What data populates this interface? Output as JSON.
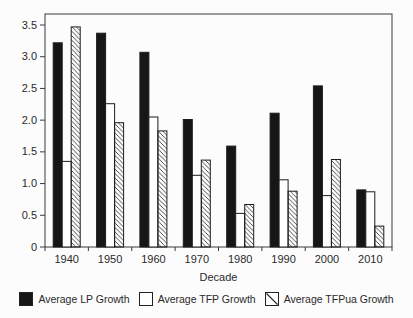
{
  "chart_data": {
    "type": "bar",
    "title": "",
    "xlabel": "Decade",
    "ylabel": "",
    "ylim": [
      0,
      3.5
    ],
    "yticks": [
      0,
      0.5,
      1.0,
      1.5,
      2.0,
      2.5,
      3.0,
      3.5
    ],
    "ytick_labels": [
      "0",
      "0.5",
      "1.0",
      "1.5",
      "2.0",
      "2.5",
      "3.0",
      "3.5"
    ],
    "grid": false,
    "legend_position": "bottom",
    "categories": [
      "1940",
      "1950",
      "1960",
      "1970",
      "1980",
      "1990",
      "2000",
      "2010"
    ],
    "series": [
      {
        "name": "Average LP Growth",
        "style": "solid-black",
        "values": [
          3.22,
          3.37,
          3.07,
          2.01,
          1.59,
          2.11,
          2.54,
          0.9
        ]
      },
      {
        "name": "Average TFP Growth",
        "style": "white",
        "values": [
          1.35,
          2.26,
          2.05,
          1.13,
          0.53,
          1.06,
          0.81,
          0.87
        ]
      },
      {
        "name": "Average TFPua Growth",
        "style": "diagonal-hatch",
        "values": [
          3.47,
          1.96,
          1.83,
          1.37,
          0.67,
          0.88,
          1.38,
          0.33
        ]
      }
    ],
    "colors": {
      "bar_black": "#161616",
      "bar_white": "#ffffff",
      "outline": "#1d1d1d",
      "axis": "#3a3a3a",
      "background": "#fcfcfc"
    }
  }
}
